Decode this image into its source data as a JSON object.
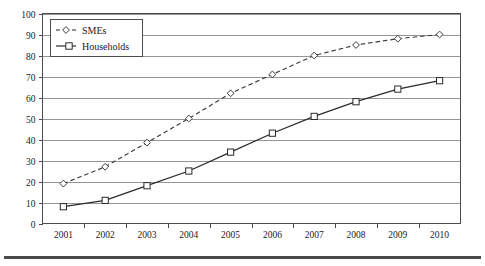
{
  "chart_data": {
    "type": "line",
    "title": "",
    "subtitle": "",
    "xlabel": "",
    "ylabel": "",
    "categories": [
      "2001",
      "2002",
      "2003",
      "2004",
      "2005",
      "2006",
      "2007",
      "2008",
      "2009",
      "2010"
    ],
    "ylim": [
      0,
      100
    ],
    "yticks": [
      "0",
      "10",
      "20",
      "30",
      "40",
      "50",
      "60",
      "70",
      "80",
      "90",
      "100"
    ],
    "grid": true,
    "grid_axis": "y",
    "legend_position": "top-left",
    "series": [
      {
        "name": "SMEs",
        "marker": "diamond",
        "linestyle": "dashed",
        "color": "#3a3a3a",
        "values": [
          19,
          27,
          38.5,
          50,
          62,
          71,
          80,
          85,
          88,
          90
        ]
      },
      {
        "name": "Households",
        "marker": "square",
        "linestyle": "solid",
        "color": "#2b2b2b",
        "values": [
          8,
          11,
          18,
          25,
          34,
          43,
          51,
          58,
          64,
          68
        ]
      }
    ]
  },
  "legend": {
    "items": [
      {
        "label": "SMEs"
      },
      {
        "label": "Households"
      }
    ]
  },
  "axes": {
    "y_max_label": "100",
    "y_min_label": "0",
    "x_first_label": "2001",
    "x_last_label": "2010"
  },
  "colors": {
    "grid": "#8a8a8a",
    "axis": "#4d4d4d",
    "series_smes": "#3a3a3a",
    "series_households": "#2b2b2b",
    "background": "#ffffff",
    "rule": "#4a4a4a"
  }
}
